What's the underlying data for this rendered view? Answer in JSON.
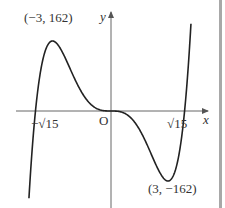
{
  "chart_data": {
    "type": "line",
    "title": "",
    "function": "y = x^5 - 15x^3",
    "xlabel": "x",
    "ylabel": "y",
    "origin_label": "O",
    "annotations": [
      {
        "text": "(−3, 162)",
        "x": -3,
        "y": 162,
        "kind": "local maximum"
      },
      {
        "text": "(3, −162)",
        "x": 3,
        "y": -162,
        "kind": "local minimum"
      },
      {
        "text": "−√15",
        "x": -3.873,
        "y": 0,
        "kind": "x-intercept"
      },
      {
        "text": "√15",
        "x": 3.873,
        "y": 0,
        "kind": "x-intercept"
      }
    ],
    "series": [
      {
        "name": "curve",
        "x": [
          -4.6,
          -4.2,
          -3.873,
          -3.5,
          -3,
          -2.5,
          -2,
          -1.5,
          -1,
          -0.5,
          0,
          0.5,
          1,
          1.5,
          2,
          2.5,
          3,
          3.5,
          3.873,
          4.2,
          4.6
        ],
        "values": [
          -359.0,
          -80.6,
          0,
          118.8,
          162,
          136.7,
          88,
          43.0,
          14,
          1.8,
          0,
          -1.8,
          -14,
          -43.0,
          -88,
          -136.7,
          -162,
          -118.8,
          0,
          80.6,
          359.0
        ]
      }
    ],
    "grid": false,
    "legend": null
  },
  "labels": {
    "y_axis": "y",
    "x_axis": "x",
    "origin": "O",
    "max_point": "(−3, 162)",
    "min_point": "(3, −162)",
    "neg_root": "−√15",
    "pos_root": "√15"
  }
}
